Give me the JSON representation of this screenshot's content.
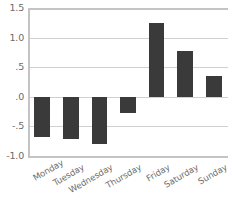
{
  "chart_data": {
    "type": "bar",
    "title": "",
    "subtitle": "",
    "xlabel": "",
    "ylabel": "",
    "categories": [
      "Monday",
      "Tuesday",
      "Wednesday",
      "Thursday",
      "Friday",
      "Saturday",
      "Sunday"
    ],
    "values": [
      -0.68,
      -0.72,
      -0.8,
      -0.28,
      1.25,
      0.78,
      0.35
    ],
    "ylim": [
      -1.0,
      1.5
    ],
    "yticks": [
      1.5,
      1.0,
      0.5,
      0.0,
      -0.5,
      -1.0
    ],
    "ytick_labels": [
      "1.5",
      "1.0",
      ".5",
      ".0",
      "-.5",
      "-1.0"
    ],
    "grid": true,
    "legend": false,
    "legend_position": "none",
    "bar_color": "#3a3a3a",
    "gridline_color": "#d0d0d0",
    "axis_color": "#c4c4c4",
    "tick_label_color": "#6b6b6b",
    "background_color": "#ffffff",
    "xtick_rotation_degrees": -30,
    "bar_width_fraction": 0.55
  }
}
